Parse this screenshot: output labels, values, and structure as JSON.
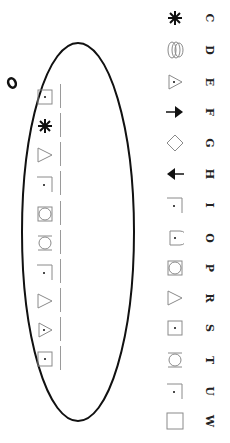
{
  "annotation": {
    "handwritten_mark": "0"
  },
  "key_items": [
    {
      "letter": "C",
      "icon": "star-icon",
      "y": 18
    },
    {
      "letter": "D",
      "icon": "overlapping-ellipses-icon",
      "y": 50
    },
    {
      "letter": "E",
      "icon": "triangle-dot-icon",
      "y": 82
    },
    {
      "letter": "F",
      "icon": "arrow-right-icon",
      "y": 112
    },
    {
      "letter": "G",
      "icon": "diamond-icon",
      "y": 143
    },
    {
      "letter": "H",
      "icon": "arrow-left-icon",
      "y": 174
    },
    {
      "letter": "I",
      "icon": "corner-dot-icon",
      "y": 205
    },
    {
      "letter": "O",
      "icon": "half-circle-dot-icon",
      "y": 238
    },
    {
      "letter": "P",
      "icon": "square-circle-icon",
      "y": 268
    },
    {
      "letter": "R",
      "icon": "triangle-icon",
      "y": 298
    },
    {
      "letter": "S",
      "icon": "square-dot-icon",
      "y": 328
    },
    {
      "letter": "T",
      "icon": "bracket-circle-icon",
      "y": 360
    },
    {
      "letter": "U",
      "icon": "corner-dot-icon",
      "y": 391
    },
    {
      "letter": "W",
      "icon": "square-icon",
      "y": 421
    }
  ],
  "sequence_items": [
    {
      "icon": "square-dot-icon",
      "y": 97
    },
    {
      "icon": "star-icon",
      "y": 126
    },
    {
      "icon": "triangle-icon",
      "y": 155
    },
    {
      "icon": "corner-dot-icon",
      "y": 184
    },
    {
      "icon": "square-circle-icon",
      "y": 214
    },
    {
      "icon": "bracket-circle-icon",
      "y": 243
    },
    {
      "icon": "corner-dot-icon",
      "y": 272
    },
    {
      "icon": "triangle-icon",
      "y": 301
    },
    {
      "icon": "triangle-dot-icon",
      "y": 330
    },
    {
      "icon": "square-dot-icon",
      "y": 359
    }
  ]
}
